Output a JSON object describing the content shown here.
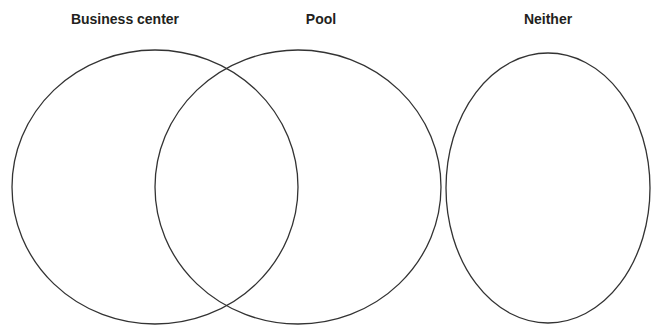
{
  "diagram": {
    "type": "venn",
    "stroke_color": "#333333",
    "label_color": "#231f20",
    "sets": [
      {
        "id": "business-center",
        "label": "Business center",
        "label_x": 125,
        "shape": {
          "cx": 155,
          "cy": 187,
          "rx": 143,
          "ry": 137
        }
      },
      {
        "id": "pool",
        "label": "Pool",
        "label_x": 321,
        "shape": {
          "cx": 298,
          "cy": 187,
          "rx": 143,
          "ry": 137
        }
      },
      {
        "id": "neither",
        "label": "Neither",
        "label_x": 548,
        "shape": {
          "cx": 548,
          "cy": 188,
          "rx": 102,
          "ry": 135
        }
      }
    ],
    "overlaps": [
      {
        "sets": [
          "business-center",
          "pool"
        ]
      }
    ]
  }
}
